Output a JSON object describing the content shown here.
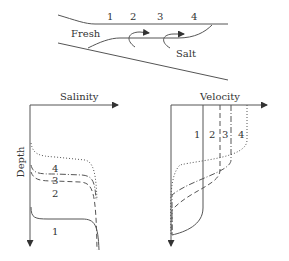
{
  "estuary": {
    "station_labels": [
      "1",
      "2",
      "3",
      "4"
    ],
    "fresh_label": "Fresh",
    "salt_label": "Salt"
  },
  "salinity_panel": {
    "x_axis_label": "Salinity",
    "y_axis_label": "Depth",
    "curve_labels": [
      "1",
      "2",
      "3",
      "4"
    ]
  },
  "velocity_panel": {
    "x_axis_label": "Velocity",
    "curve_labels": [
      "1",
      "2",
      "3",
      "4"
    ]
  },
  "colors": {
    "line": "#555555",
    "text": "#333333"
  }
}
